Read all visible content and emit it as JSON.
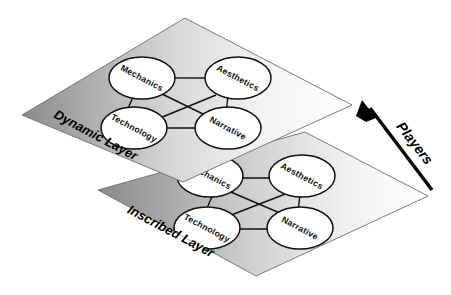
{
  "figure": {
    "background_color": "#ffffff",
    "width": 451,
    "height": 295
  },
  "layers": [
    {
      "id": "dynamic-layer",
      "label": "Dynamic Layer",
      "position": "upper",
      "fill_left_color": "#8d8d8d",
      "fill_right_color": "#ffffff",
      "border_color": "#6e6e6e",
      "nodes": [
        {
          "id": "mechanics",
          "label": "Mechanics",
          "corner": "top-left"
        },
        {
          "id": "aesthetics",
          "label": "Aesthetics",
          "corner": "top-right"
        },
        {
          "id": "technology",
          "label": "Technology",
          "corner": "bottom-left"
        },
        {
          "id": "narrative",
          "label": "Narrative",
          "corner": "bottom-right"
        }
      ],
      "edges": [
        {
          "from": "mechanics",
          "to": "aesthetics"
        },
        {
          "from": "mechanics",
          "to": "technology"
        },
        {
          "from": "mechanics",
          "to": "narrative"
        },
        {
          "from": "aesthetics",
          "to": "technology"
        },
        {
          "from": "aesthetics",
          "to": "narrative"
        },
        {
          "from": "technology",
          "to": "narrative"
        }
      ]
    },
    {
      "id": "inscribed-layer",
      "label": "Inscribed Layer",
      "position": "lower",
      "fill_left_color": "#8d8d8d",
      "fill_right_color": "#ffffff",
      "border_color": "#6e6e6e",
      "nodes": [
        {
          "id": "mechanics",
          "label": "Mechanics",
          "corner": "top-left",
          "occluded": true
        },
        {
          "id": "aesthetics",
          "label": "Aesthetics",
          "corner": "top-right",
          "occluded": false
        },
        {
          "id": "technology",
          "label": "Technology",
          "corner": "bottom-left",
          "occluded": false
        },
        {
          "id": "narrative",
          "label": "Narrative",
          "corner": "bottom-right",
          "occluded": false
        }
      ],
      "edges": [
        {
          "from": "mechanics",
          "to": "aesthetics"
        },
        {
          "from": "mechanics",
          "to": "technology"
        },
        {
          "from": "mechanics",
          "to": "narrative"
        },
        {
          "from": "aesthetics",
          "to": "technology"
        },
        {
          "from": "aesthetics",
          "to": "narrative"
        },
        {
          "from": "technology",
          "to": "narrative"
        }
      ]
    }
  ],
  "annotation": {
    "arrow_label": "Players",
    "arrow_direction": "from inscribed layer upward to dynamic layer",
    "arrow_color": "#000000"
  }
}
